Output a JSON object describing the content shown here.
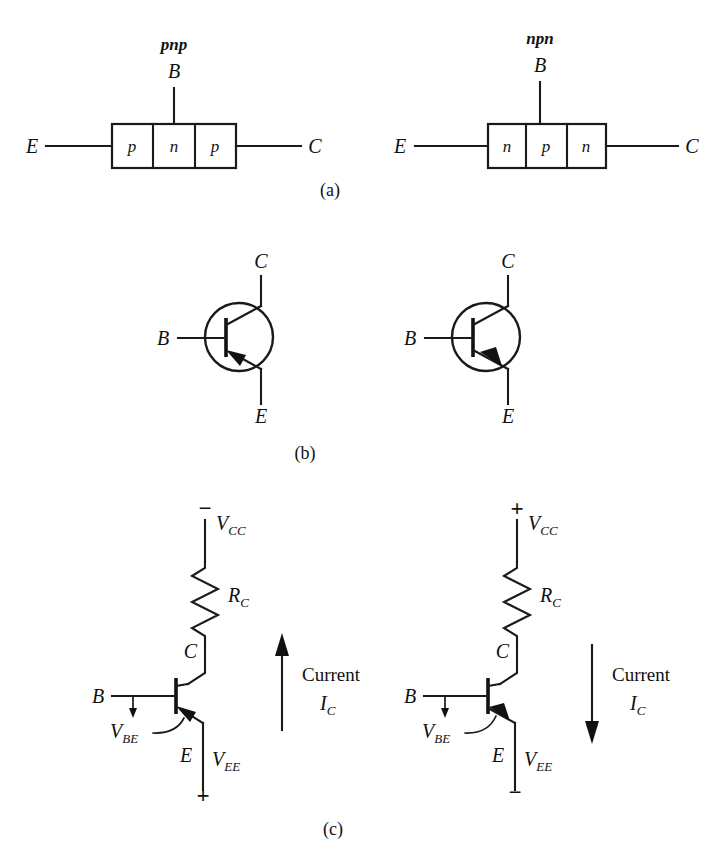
{
  "figure": {
    "title_parts": [
      "(a)",
      "(b)",
      "(c)"
    ],
    "background_color": "#ffffff",
    "line_color": "#1a1a1a"
  },
  "part_a": {
    "caption": "(a)",
    "left": {
      "type_label": "pnp",
      "base_label": "B",
      "emitter_label": "E",
      "collector_label": "C",
      "regions": [
        "p",
        "n",
        "p"
      ]
    },
    "right": {
      "type_label": "npn",
      "base_label": "B",
      "emitter_label": "E",
      "collector_label": "C",
      "regions": [
        "n",
        "p",
        "n"
      ]
    }
  },
  "part_b": {
    "caption": "(b)",
    "left": {
      "symbol": "pnp-transistor-symbol",
      "collector_label": "C",
      "base_label": "B",
      "emitter_label": "E",
      "arrow_direction": "into-base"
    },
    "right": {
      "symbol": "npn-transistor-symbol",
      "collector_label": "C",
      "base_label": "B",
      "emitter_label": "E",
      "arrow_direction": "out-of-base"
    }
  },
  "part_c": {
    "caption": "(c)",
    "left": {
      "supply_label": "V",
      "supply_sub": "CC",
      "supply_sign": "−",
      "resistor_label": "R",
      "resistor_sub": "C",
      "collector_label": "C",
      "base_label": "B",
      "emitter_label": "E",
      "vbe_label": "V",
      "vbe_sub": "BE",
      "vee_label": "V",
      "vee_sub": "EE",
      "vee_sign": "+",
      "current_label": "Current",
      "current_symbol": "I",
      "current_sub": "C",
      "current_direction": "up"
    },
    "right": {
      "supply_label": "V",
      "supply_sub": "CC",
      "supply_sign": "+",
      "resistor_label": "R",
      "resistor_sub": "C",
      "collector_label": "C",
      "base_label": "B",
      "emitter_label": "E",
      "vbe_label": "V",
      "vbe_sub": "BE",
      "vee_label": "V",
      "vee_sub": "EE",
      "vee_sign": "−",
      "current_label": "Current",
      "current_symbol": "I",
      "current_sub": "C",
      "current_direction": "down"
    }
  }
}
